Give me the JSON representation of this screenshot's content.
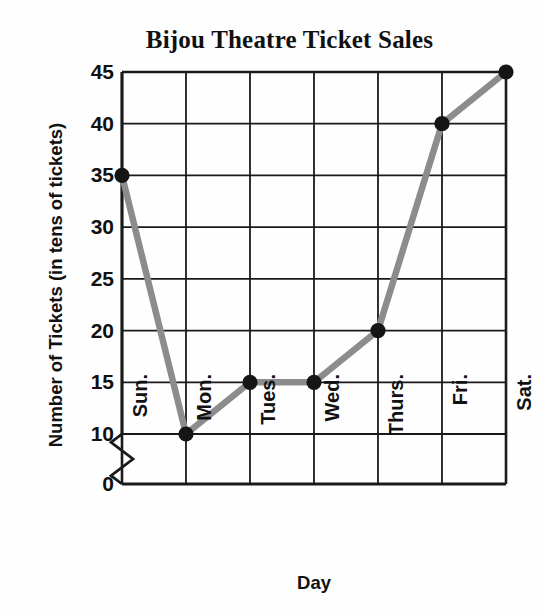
{
  "chart_data": {
    "type": "line",
    "title": "Bijou Theatre Ticket Sales",
    "xlabel": "Day",
    "ylabel": "Number of Tickets (in tens of tickets)",
    "categories": [
      "Sun.",
      "Mon.",
      "Tues.",
      "Wed.",
      "Thurs.",
      "Fri.",
      "Sat."
    ],
    "values": [
      35,
      10,
      15,
      15,
      20,
      40,
      45
    ],
    "series": [
      {
        "name": "Tickets",
        "values": [
          35,
          10,
          15,
          15,
          20,
          40,
          45
        ]
      }
    ],
    "points": [
      {
        "x": "Sun.",
        "y": 35
      },
      {
        "x": "Mon.",
        "y": 10
      },
      {
        "x": "Tues.",
        "y": 15
      },
      {
        "x": "Wed.",
        "y": 15
      },
      {
        "x": "Thurs.",
        "y": 20
      },
      {
        "x": "Fri.",
        "y": 40
      },
      {
        "x": "Sat.",
        "y": 45
      }
    ],
    "ylim": [
      10,
      45
    ],
    "yticks": [
      0,
      10,
      15,
      20,
      25,
      30,
      35,
      40,
      45
    ],
    "ytick_labels": [
      "0",
      "10",
      "15",
      "20",
      "25",
      "30",
      "35",
      "40",
      "45"
    ],
    "xtick_labels": [
      "Sun.",
      "Mon.",
      "Tues.",
      "Wed.",
      "Thurs.",
      "Fri.",
      "Sat."
    ],
    "grid": true,
    "legend": false,
    "axis_break": true,
    "axis_break_note": "zigzag break on y-axis between 0 and 10",
    "line_color": "#8c8c8c",
    "marker_color": "#151515",
    "grid_color": "#1a1a1a",
    "background_color": "#fefefe"
  }
}
